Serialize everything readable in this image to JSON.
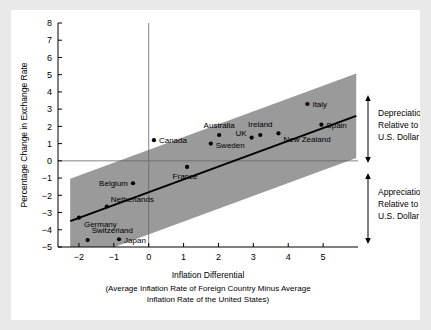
{
  "chart_data": {
    "type": "scatter",
    "title": "",
    "xlabel": "Inflation Differential",
    "xlabel_sub_line1": "(Average Inflation Rate of Foreign Country Minus Average",
    "xlabel_sub_line2": "Inflation Rate of the United States)",
    "ylabel": "Percentage Change in Exchange Rate",
    "xlim": [
      -2.6,
      6.0
    ],
    "ylim": [
      -5,
      8
    ],
    "xticks": [
      -2,
      -1,
      0,
      1,
      2,
      3,
      4,
      5
    ],
    "xtick_labels": [
      "−2",
      "−1",
      "0",
      "1",
      "2",
      "3",
      "4",
      "5"
    ],
    "yticks": [
      -5,
      -4,
      -3,
      -2,
      -1,
      0,
      1,
      2,
      3,
      4,
      5,
      6,
      7,
      8
    ],
    "ytick_labels": [
      "−5",
      "−4",
      "−3",
      "−2",
      "−1",
      "0",
      "1",
      "2",
      "3",
      "4",
      "5",
      "6",
      "7",
      "8"
    ],
    "grid": false,
    "legend": "none",
    "zero_line_y": 0,
    "zero_line_x": 0,
    "band_color": "#9a9a9a",
    "fit_line": {
      "slope": 0.745,
      "intercept": -1.82,
      "x_start": -2.25,
      "x_end": 5.95
    },
    "band": {
      "offset": 2.45,
      "x_start": -2.25,
      "x_end": 5.95
    },
    "points": [
      {
        "name": "Germany",
        "x": -2.0,
        "y": -3.3,
        "label_dx": 5,
        "label_dy": 9,
        "anchor": "start"
      },
      {
        "name": "Switzerland",
        "x": -1.75,
        "y": -4.6,
        "label_dx": 4,
        "label_dy": -7,
        "anchor": "start"
      },
      {
        "name": "Netherlands",
        "x": -1.2,
        "y": -2.65,
        "label_dx": 4,
        "label_dy": -5,
        "anchor": "start"
      },
      {
        "name": "Japan",
        "x": -0.85,
        "y": -4.55,
        "label_dx": 5,
        "label_dy": 4,
        "anchor": "start"
      },
      {
        "name": "Belgium",
        "x": -0.45,
        "y": -1.3,
        "label_dx": -5,
        "label_dy": 3,
        "anchor": "end"
      },
      {
        "name": "Canada",
        "x": 0.15,
        "y": 1.2,
        "label_dx": 5,
        "label_dy": 3,
        "anchor": "start"
      },
      {
        "name": "France",
        "x": 1.1,
        "y": -0.35,
        "label_dx": -2,
        "label_dy": 12,
        "anchor": "middle"
      },
      {
        "name": "Sweden",
        "x": 1.78,
        "y": 1.0,
        "label_dx": 5,
        "label_dy": 4,
        "anchor": "start"
      },
      {
        "name": "Australia",
        "x": 2.02,
        "y": 1.5,
        "label_dx": 0,
        "label_dy": -7,
        "anchor": "middle"
      },
      {
        "name": "UK",
        "x": 2.95,
        "y": 1.35,
        "label_dx": -5,
        "label_dy": -2,
        "anchor": "end"
      },
      {
        "name": "Ireland",
        "x": 3.2,
        "y": 1.5,
        "label_dx": 0,
        "label_dy": -8,
        "anchor": "middle"
      },
      {
        "name": "New Zealand",
        "x": 3.72,
        "y": 1.6,
        "label_dx": 5,
        "label_dy": 9,
        "anchor": "start"
      },
      {
        "name": "Italy",
        "x": 4.55,
        "y": 3.3,
        "label_dx": 5,
        "label_dy": 3,
        "anchor": "start"
      },
      {
        "name": "Spain",
        "x": 4.95,
        "y": 2.1,
        "label_dx": 5,
        "label_dy": 3,
        "anchor": "start"
      }
    ]
  },
  "annotations": {
    "depreciation": {
      "line1": "Depreciation",
      "line2": "Relative to",
      "line3": "U.S. Dollar"
    },
    "appreciation": {
      "line1": "Appreciation",
      "line2": "Relative to",
      "line3": "U.S. Dollar"
    }
  }
}
